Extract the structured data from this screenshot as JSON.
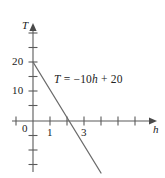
{
  "chart_data": {
    "type": "line",
    "title": "",
    "subtitle": "",
    "xlabel": "h",
    "ylabel": "T",
    "xlim": [
      -1.2,
      7.0
    ],
    "ylim": [
      -17.5,
      32.5
    ],
    "grid": false,
    "legend": "none",
    "equation_label": "T = −10h + 20",
    "equation_parts": {
      "lhs": "T",
      "equals": "=",
      "slope_term": "−10h",
      "plus": "+",
      "intercept": "20"
    },
    "series": [
      {
        "name": "T = -10h + 20",
        "slope": -10,
        "intercept": 20,
        "color": "#6b6b6b",
        "points": [
          {
            "x": 0,
            "y": 20
          },
          {
            "x": 2,
            "y": 0
          },
          {
            "x": 4,
            "y": -20
          }
        ],
        "x_intercept": 2,
        "y_intercept": 20
      }
    ],
    "x_ticks": [
      {
        "value": 0,
        "label": ""
      },
      {
        "value": 1,
        "label": "1"
      },
      {
        "value": 2,
        "label": ""
      },
      {
        "value": 3,
        "label": "3"
      },
      {
        "value": 4,
        "label": ""
      },
      {
        "value": 5,
        "label": ""
      },
      {
        "value": 6,
        "label": ""
      }
    ],
    "y_ticks": [
      {
        "value": 30,
        "label": ""
      },
      {
        "value": 25,
        "label": ""
      },
      {
        "value": 20,
        "label": "20"
      },
      {
        "value": 15,
        "label": ""
      },
      {
        "value": 10,
        "label": "10"
      },
      {
        "value": 5,
        "label": ""
      },
      {
        "value": 0,
        "label": ""
      },
      {
        "value": -5,
        "label": ""
      },
      {
        "value": -10,
        "label": ""
      },
      {
        "value": -15,
        "label": ""
      }
    ],
    "origin_label": "0"
  },
  "axes": {
    "y_axis_name": "T",
    "x_axis_name": "h",
    "axis_color": "#5a5a5a",
    "line_color": "#6b6b6b",
    "text_color": "#1a1a1a",
    "background": "#ffffff"
  },
  "tick_labels": {
    "y20": "20",
    "y10": "10",
    "origin": "0",
    "x1": "1",
    "x3": "3"
  }
}
